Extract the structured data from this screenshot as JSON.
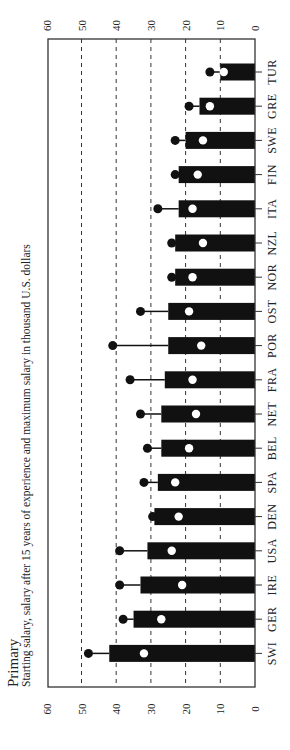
{
  "chart_data": {
    "type": "bar",
    "orientation": "rotated-90-ccw",
    "title": "Primary",
    "subtitle": "Starting salary, salary after 15 years of experience and maximum salary in thousand U.S. dollars",
    "xlabel": "",
    "ylabel": "",
    "ylim": [
      0,
      60
    ],
    "yticks": [
      0,
      10,
      20,
      30,
      40,
      50,
      60
    ],
    "grid": "dashed at 10,20,30,40,50",
    "categories": [
      "TUR",
      "GRE",
      "SWE",
      "FIN",
      "ITA",
      "NZL",
      "NOR",
      "OST",
      "POR",
      "FRA",
      "NET",
      "BEL",
      "SPA",
      "DEN",
      "USA",
      "IRE",
      "GER",
      "SWI"
    ],
    "series": [
      {
        "name": "Salary after 15 years of experience",
        "marker": "bar",
        "values": [
          10,
          16,
          20,
          22,
          22,
          23,
          23,
          25,
          25,
          26,
          27,
          27,
          28,
          29,
          31,
          33,
          35,
          42
        ]
      },
      {
        "name": "Starting salary",
        "marker": "white-dot",
        "values": [
          9,
          13,
          15,
          16.5,
          18,
          15,
          18,
          19,
          15.5,
          18,
          17,
          19,
          23,
          22,
          24,
          21,
          27,
          32
        ]
      },
      {
        "name": "Maximum salary",
        "marker": "black-dot",
        "values": [
          13,
          19,
          23,
          23,
          28,
          24,
          24,
          33,
          41,
          36,
          33,
          31,
          32,
          29.5,
          39,
          39,
          38,
          48
        ]
      }
    ]
  },
  "colors": {
    "bar": "#111111",
    "max_dot": "#111111",
    "start_dot": "#ffffff",
    "frame": "#333333",
    "grid": "#333333",
    "background": "#ffffff"
  }
}
